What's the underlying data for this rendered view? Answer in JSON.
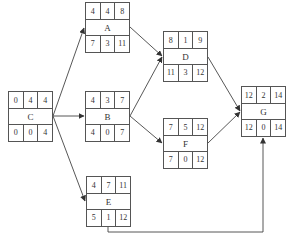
{
  "diagram": {
    "type": "activity-on-node network",
    "nodes": [
      {
        "id": "C",
        "label": "C",
        "top": [
          "0",
          "4",
          "4"
        ],
        "bottom": [
          "0",
          "0",
          "4"
        ],
        "x": 8,
        "y": 91
      },
      {
        "id": "A",
        "label": "A",
        "top": [
          "4",
          "4",
          "8"
        ],
        "bottom": [
          "7",
          "3",
          "11"
        ],
        "x": 85,
        "y": 2
      },
      {
        "id": "B",
        "label": "B",
        "top": [
          "4",
          "3",
          "7"
        ],
        "bottom": [
          "4",
          "0",
          "7"
        ],
        "x": 85,
        "y": 91
      },
      {
        "id": "E",
        "label": "E",
        "top": [
          "4",
          "7",
          "11"
        ],
        "bottom": [
          "5",
          "1",
          "12"
        ],
        "x": 86,
        "y": 176
      },
      {
        "id": "D",
        "label": "D",
        "top": [
          "8",
          "1",
          "9"
        ],
        "bottom": [
          "11",
          "3",
          "12"
        ],
        "x": 163,
        "y": 31
      },
      {
        "id": "F",
        "label": "F",
        "top": [
          "7",
          "5",
          "12"
        ],
        "bottom": [
          "7",
          "0",
          "12"
        ],
        "x": 163,
        "y": 118
      },
      {
        "id": "G",
        "label": "G",
        "top": [
          "12",
          "2",
          "14"
        ],
        "bottom": [
          "12",
          "0",
          "14"
        ],
        "x": 241,
        "y": 86
      }
    ],
    "edges": [
      {
        "from": "C",
        "to": "A"
      },
      {
        "from": "C",
        "to": "B"
      },
      {
        "from": "C",
        "to": "E"
      },
      {
        "from": "A",
        "to": "D"
      },
      {
        "from": "B",
        "to": "D"
      },
      {
        "from": "B",
        "to": "F"
      },
      {
        "from": "D",
        "to": "G"
      },
      {
        "from": "F",
        "to": "G"
      },
      {
        "from": "E",
        "to": "G"
      }
    ]
  }
}
